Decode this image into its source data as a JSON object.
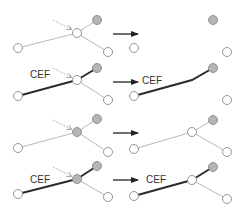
{
  "colors": {
    "thin_edge": "#b8b8b8",
    "thick_edge": "#2b2b2b",
    "node_stroke": "#8a8a8a",
    "node_white": "#ffffff",
    "node_gray": "#b5b5b5",
    "arrow": "#222222",
    "dotted_arrow": "#9a9a9a",
    "label": "#333333"
  },
  "label_text": "CEF",
  "rows": [
    {
      "id": "row1",
      "left": {
        "nodes": [
          {
            "id": "a",
            "x": 18,
            "y": 48,
            "fill": "white"
          },
          {
            "id": "b",
            "x": 77,
            "y": 33,
            "fill": "white"
          },
          {
            "id": "c",
            "x": 97,
            "y": 20,
            "fill": "gray"
          },
          {
            "id": "d",
            "x": 108,
            "y": 52,
            "fill": "white"
          }
        ],
        "edges": [
          {
            "from": "a",
            "to": "b",
            "style": "thin"
          },
          {
            "from": "b",
            "to": "c",
            "style": "thin"
          },
          {
            "from": "b",
            "to": "d",
            "style": "thin"
          }
        ],
        "dotted_arrow": {
          "x1": 53,
          "y1": 20,
          "x2": 71,
          "y2": 29
        },
        "label": null
      },
      "transition_arrow": {
        "x1": 113,
        "y1": 34,
        "x2": 139,
        "y2": 34
      },
      "right": {
        "nodes": [
          {
            "id": "a",
            "x": 134,
            "y": 48,
            "fill": "white"
          },
          {
            "id": "c",
            "x": 213,
            "y": 20,
            "fill": "gray"
          },
          {
            "id": "d",
            "x": 227,
            "y": 52,
            "fill": "white"
          }
        ],
        "edges": [],
        "label": null
      }
    },
    {
      "id": "row2",
      "left": {
        "nodes": [
          {
            "id": "a",
            "x": 18,
            "y": 96,
            "fill": "white"
          },
          {
            "id": "b",
            "x": 77,
            "y": 80,
            "fill": "white"
          },
          {
            "id": "c",
            "x": 97,
            "y": 68,
            "fill": "gray"
          },
          {
            "id": "d",
            "x": 108,
            "y": 100,
            "fill": "white"
          }
        ],
        "edges": [
          {
            "from": "a",
            "to": "b",
            "style": "thick"
          },
          {
            "from": "b",
            "to": "c",
            "style": "thick"
          },
          {
            "from": "b",
            "to": "d",
            "style": "thin"
          }
        ],
        "dotted_arrow": {
          "x1": 53,
          "y1": 68,
          "x2": 71,
          "y2": 77
        },
        "label": {
          "x": 30,
          "y": 78
        }
      },
      "transition_arrow": {
        "x1": 113,
        "y1": 82,
        "x2": 139,
        "y2": 82
      },
      "right": {
        "nodes": [
          {
            "id": "a",
            "x": 134,
            "y": 96,
            "fill": "white"
          },
          {
            "id": "c",
            "x": 213,
            "y": 68,
            "fill": "gray"
          },
          {
            "id": "d",
            "x": 227,
            "y": 100,
            "fill": "white"
          }
        ],
        "edges": [
          {
            "points": "134,96 192,80 213,68",
            "style": "thick"
          }
        ],
        "label": {
          "x": 142,
          "y": 84
        }
      }
    },
    {
      "id": "row3",
      "left": {
        "nodes": [
          {
            "id": "a",
            "x": 18,
            "y": 148,
            "fill": "white"
          },
          {
            "id": "b",
            "x": 77,
            "y": 132,
            "fill": "gray"
          },
          {
            "id": "c",
            "x": 97,
            "y": 119,
            "fill": "gray"
          },
          {
            "id": "d",
            "x": 108,
            "y": 152,
            "fill": "white"
          }
        ],
        "edges": [
          {
            "from": "a",
            "to": "b",
            "style": "thin"
          },
          {
            "from": "b",
            "to": "c",
            "style": "thin"
          },
          {
            "from": "b",
            "to": "d",
            "style": "thin"
          }
        ],
        "dotted_arrow": {
          "x1": 53,
          "y1": 120,
          "x2": 71,
          "y2": 129
        },
        "label": null
      },
      "transition_arrow": {
        "x1": 113,
        "y1": 133,
        "x2": 139,
        "y2": 133
      },
      "right": {
        "nodes": [
          {
            "id": "a",
            "x": 134,
            "y": 149,
            "fill": "white"
          },
          {
            "id": "b",
            "x": 192,
            "y": 132,
            "fill": "white"
          },
          {
            "id": "c",
            "x": 213,
            "y": 120,
            "fill": "gray"
          },
          {
            "id": "d",
            "x": 227,
            "y": 152,
            "fill": "white"
          }
        ],
        "edges": [
          {
            "from": "a",
            "to": "b",
            "style": "thin"
          },
          {
            "from": "b",
            "to": "c",
            "style": "thin"
          },
          {
            "from": "b",
            "to": "d",
            "style": "thin"
          }
        ],
        "label": null
      }
    },
    {
      "id": "row4",
      "left": {
        "nodes": [
          {
            "id": "a",
            "x": 18,
            "y": 194,
            "fill": "white"
          },
          {
            "id": "b",
            "x": 77,
            "y": 179,
            "fill": "gray"
          },
          {
            "id": "c",
            "x": 97,
            "y": 166,
            "fill": "gray"
          },
          {
            "id": "d",
            "x": 108,
            "y": 197,
            "fill": "white"
          }
        ],
        "edges": [
          {
            "from": "a",
            "to": "b",
            "style": "thick"
          },
          {
            "from": "b",
            "to": "c",
            "style": "thick"
          },
          {
            "from": "b",
            "to": "d",
            "style": "thin"
          }
        ],
        "dotted_arrow": {
          "x1": 53,
          "y1": 167,
          "x2": 71,
          "y2": 176
        },
        "label": {
          "x": 30,
          "y": 183
        }
      },
      "transition_arrow": {
        "x1": 113,
        "y1": 180,
        "x2": 139,
        "y2": 180
      },
      "right": {
        "nodes": [
          {
            "id": "a",
            "x": 134,
            "y": 196,
            "fill": "white"
          },
          {
            "id": "b",
            "x": 192,
            "y": 180,
            "fill": "white"
          },
          {
            "id": "c",
            "x": 213,
            "y": 167,
            "fill": "gray"
          },
          {
            "id": "d",
            "x": 227,
            "y": 199,
            "fill": "white"
          }
        ],
        "edges": [
          {
            "from": "a",
            "to": "b",
            "style": "thick"
          },
          {
            "from": "b",
            "to": "c",
            "style": "thick"
          },
          {
            "from": "b",
            "to": "d",
            "style": "thin"
          }
        ],
        "label": {
          "x": 146,
          "y": 183
        }
      }
    }
  ]
}
